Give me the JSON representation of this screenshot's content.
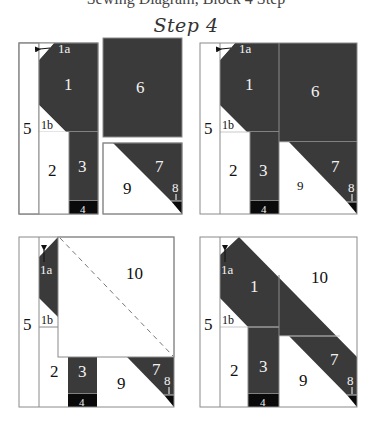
{
  "header": {
    "cut_text": "Sewing Diagram, Block 4 Step",
    "title": "Step 4"
  },
  "colors": {
    "dark": "#3a3a3a",
    "black": "#0a0a0a",
    "light": "#ffffff",
    "line": "#8a8a8a",
    "seam": "#c9c9c9",
    "text_dark": "#111111",
    "text_light": "#f2f2f2"
  },
  "panels": [
    {
      "name": "panel-top-left",
      "labels": {
        "p1a": "1a",
        "p1": "1",
        "p1b": "1b",
        "p2": "2",
        "p3": "3",
        "p4": "4",
        "p5": "5",
        "p6": "6",
        "p7": "7",
        "p8": "8",
        "p9": "9"
      }
    },
    {
      "name": "panel-top-right",
      "labels": {
        "p1a": "1a",
        "p1": "1",
        "p1b": "1b",
        "p2": "2",
        "p3": "3",
        "p4": "4",
        "p5": "5",
        "p6": "6",
        "p7": "7",
        "p8": "8",
        "p9": "9"
      }
    },
    {
      "name": "panel-bottom-left",
      "labels": {
        "p1a": "1a",
        "p1b": "1b",
        "p2": "2",
        "p3": "3",
        "p4": "4",
        "p5": "5",
        "p7": "7",
        "p8": "8",
        "p9": "9",
        "p10": "10"
      }
    },
    {
      "name": "panel-bottom-right",
      "labels": {
        "p1a": "1a",
        "p1": "1",
        "p1b": "1b",
        "p2": "2",
        "p3": "3",
        "p4": "4",
        "p5": "5",
        "p7": "7",
        "p8": "8",
        "p9": "9",
        "p10": "10"
      }
    }
  ]
}
